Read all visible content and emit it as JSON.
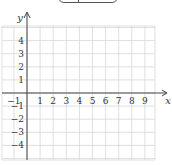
{
  "figure": {
    "type": "coordinate-grid",
    "x_axis_label": "x",
    "y_axis_label": "y",
    "x_range": [
      -2,
      10
    ],
    "y_range": [
      -5,
      5
    ],
    "x_tick_labels": [
      "-1",
      "1",
      "2",
      "3",
      "4",
      "5",
      "6",
      "7",
      "8",
      "9"
    ],
    "y_tick_labels": [
      "4",
      "3",
      "2",
      "1",
      "-1",
      "-2",
      "-3",
      "-4"
    ],
    "grid_color": "#d8d8d8",
    "axis_color": "#444444"
  }
}
